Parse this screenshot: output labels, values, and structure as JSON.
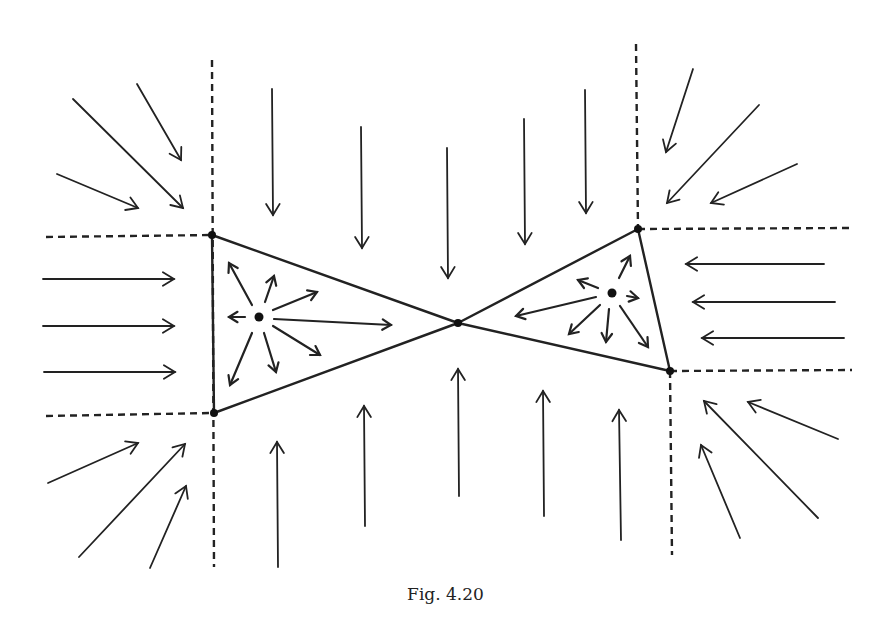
{
  "figure": {
    "caption": "Fig. 4.20",
    "colors": {
      "ink": "#222222",
      "background": "#ffffff"
    },
    "dashed_lines": [
      {
        "id": "left-vertical",
        "x1": 212,
        "y1": 60,
        "x2": 214,
        "y2": 567
      },
      {
        "id": "left-top-horizontal",
        "x1": 46,
        "y1": 237,
        "x2": 212,
        "y2": 235
      },
      {
        "id": "left-bottom-horizontal",
        "x1": 46,
        "y1": 416,
        "x2": 212,
        "y2": 413
      },
      {
        "id": "right-top-vertical",
        "x1": 636,
        "y1": 44,
        "x2": 638,
        "y2": 229
      },
      {
        "id": "right-top-horizontal",
        "x1": 638,
        "y1": 229,
        "x2": 850,
        "y2": 228
      },
      {
        "id": "right-bottom-vertical",
        "x1": 670,
        "y1": 371,
        "x2": 672,
        "y2": 555
      },
      {
        "id": "right-bottom-horizontal",
        "x1": 670,
        "y1": 371,
        "x2": 852,
        "y2": 370
      }
    ],
    "triangles": [
      {
        "id": "left-triangle",
        "points": [
          [
            212,
            235
          ],
          [
            214,
            413
          ],
          [
            458,
            323
          ]
        ],
        "source": [
          259,
          317
        ]
      },
      {
        "id": "right-triangle",
        "points": [
          [
            458,
            323
          ],
          [
            638,
            229
          ],
          [
            670,
            371
          ]
        ],
        "source": [
          612,
          293
        ]
      }
    ],
    "nodes": [
      {
        "id": "vertex-left-top",
        "x": 212,
        "y": 235
      },
      {
        "id": "vertex-left-bottom",
        "x": 214,
        "y": 413
      },
      {
        "id": "vertex-center",
        "x": 458,
        "y": 323
      },
      {
        "id": "vertex-right-top",
        "x": 638,
        "y": 229
      },
      {
        "id": "vertex-right-bottom",
        "x": 670,
        "y": 371
      },
      {
        "id": "source-left",
        "x": 259,
        "y": 317
      },
      {
        "id": "source-right",
        "x": 612,
        "y": 293
      }
    ],
    "arrows_outer": [
      {
        "group": "top-left",
        "from": [
          137,
          84
        ],
        "to": [
          181,
          160
        ]
      },
      {
        "group": "top-left",
        "from": [
          73,
          99
        ],
        "to": [
          183,
          208
        ]
      },
      {
        "group": "top-left",
        "from": [
          57,
          174
        ],
        "to": [
          138,
          208
        ]
      },
      {
        "group": "left",
        "from": [
          43,
          279
        ],
        "to": [
          174,
          279
        ]
      },
      {
        "group": "left",
        "from": [
          43,
          326
        ],
        "to": [
          174,
          326
        ]
      },
      {
        "group": "left",
        "from": [
          44,
          372
        ],
        "to": [
          175,
          372
        ]
      },
      {
        "group": "bottom-left",
        "from": [
          48,
          483
        ],
        "to": [
          138,
          443
        ]
      },
      {
        "group": "bottom-left",
        "from": [
          79,
          557
        ],
        "to": [
          185,
          444
        ]
      },
      {
        "group": "bottom-left",
        "from": [
          150,
          568
        ],
        "to": [
          186,
          486
        ]
      },
      {
        "group": "top",
        "from": [
          272,
          89
        ],
        "to": [
          273,
          215
        ]
      },
      {
        "group": "top",
        "from": [
          361,
          127
        ],
        "to": [
          362,
          248
        ]
      },
      {
        "group": "top",
        "from": [
          447,
          148
        ],
        "to": [
          448,
          278
        ]
      },
      {
        "group": "top",
        "from": [
          524,
          119
        ],
        "to": [
          525,
          244
        ]
      },
      {
        "group": "top",
        "from": [
          585,
          90
        ],
        "to": [
          586,
          213
        ]
      },
      {
        "group": "bottom",
        "from": [
          278,
          567
        ],
        "to": [
          277,
          442
        ]
      },
      {
        "group": "bottom",
        "from": [
          365,
          526
        ],
        "to": [
          364,
          406
        ]
      },
      {
        "group": "bottom",
        "from": [
          459,
          496
        ],
        "to": [
          458,
          369
        ]
      },
      {
        "group": "bottom",
        "from": [
          544,
          516
        ],
        "to": [
          543,
          391
        ]
      },
      {
        "group": "bottom",
        "from": [
          621,
          540
        ],
        "to": [
          619,
          410
        ]
      },
      {
        "group": "top-right",
        "from": [
          693,
          69
        ],
        "to": [
          666,
          152
        ]
      },
      {
        "group": "top-right",
        "from": [
          759,
          105
        ],
        "to": [
          667,
          203
        ]
      },
      {
        "group": "top-right",
        "from": [
          797,
          164
        ],
        "to": [
          711,
          203
        ]
      },
      {
        "group": "right",
        "from": [
          824,
          264
        ],
        "to": [
          686,
          264
        ]
      },
      {
        "group": "right",
        "from": [
          835,
          302
        ],
        "to": [
          693,
          302
        ]
      },
      {
        "group": "right",
        "from": [
          844,
          338
        ],
        "to": [
          702,
          338
        ]
      },
      {
        "group": "bottom-right",
        "from": [
          838,
          439
        ],
        "to": [
          748,
          402
        ]
      },
      {
        "group": "bottom-right",
        "from": [
          818,
          518
        ],
        "to": [
          704,
          401
        ]
      },
      {
        "group": "bottom-right",
        "from": [
          740,
          538
        ],
        "to": [
          701,
          445
        ]
      }
    ],
    "arrows_inner_left": [
      {
        "dir": "up-left",
        "from": [
          252,
          305
        ],
        "to": [
          229,
          263
        ]
      },
      {
        "dir": "up",
        "from": [
          265,
          302
        ],
        "to": [
          274,
          276
        ]
      },
      {
        "dir": "up-right",
        "from": [
          273,
          310
        ],
        "to": [
          317,
          292
        ]
      },
      {
        "dir": "left",
        "from": [
          245,
          317
        ],
        "to": [
          229,
          317
        ]
      },
      {
        "dir": "right",
        "from": [
          274,
          319
        ],
        "to": [
          391,
          325
        ]
      },
      {
        "dir": "down-right",
        "from": [
          273,
          326
        ],
        "to": [
          320,
          355
        ]
      },
      {
        "dir": "down",
        "from": [
          264,
          333
        ],
        "to": [
          276,
          372
        ]
      },
      {
        "dir": "down-left",
        "from": [
          252,
          333
        ],
        "to": [
          230,
          385
        ]
      }
    ],
    "arrows_inner_right": [
      {
        "dir": "up-right",
        "from": [
          619,
          278
        ],
        "to": [
          630,
          256
        ]
      },
      {
        "dir": "up-left",
        "from": [
          598,
          288
        ],
        "to": [
          578,
          280
        ]
      },
      {
        "dir": "right",
        "from": [
          627,
          296
        ],
        "to": [
          638,
          298
        ]
      },
      {
        "dir": "left",
        "from": [
          596,
          297
        ],
        "to": [
          516,
          316
        ]
      },
      {
        "dir": "down-left",
        "from": [
          600,
          305
        ],
        "to": [
          569,
          334
        ]
      },
      {
        "dir": "down",
        "from": [
          609,
          309
        ],
        "to": [
          606,
          342
        ]
      },
      {
        "dir": "down-right",
        "from": [
          620,
          306
        ],
        "to": [
          648,
          347
        ]
      }
    ]
  }
}
